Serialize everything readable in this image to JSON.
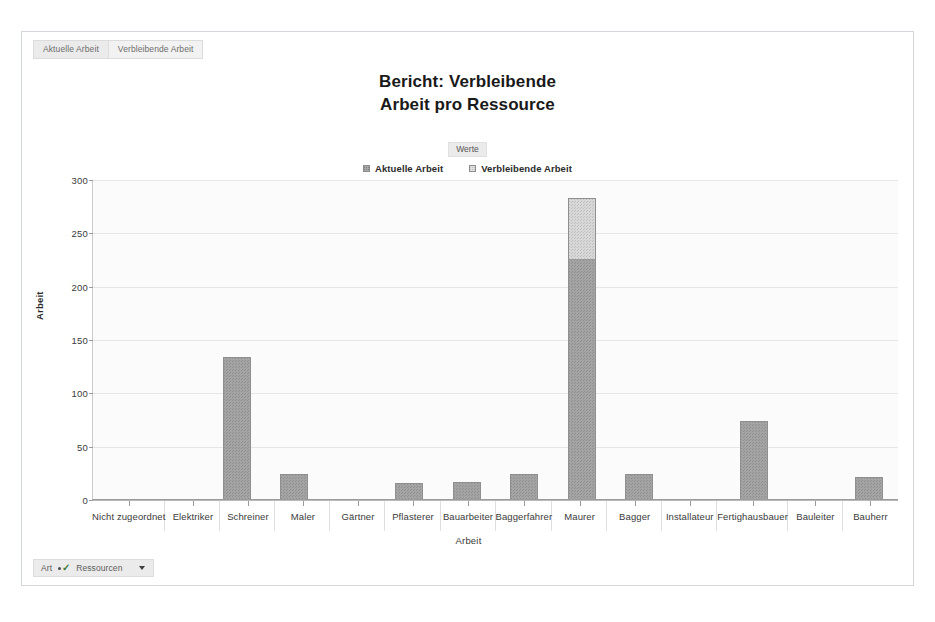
{
  "tabs": [
    {
      "label": "Aktuelle Arbeit",
      "active": false
    },
    {
      "label": "Verbleibende Arbeit",
      "active": true
    }
  ],
  "title": {
    "line1": "Bericht: Verbleibende",
    "line2": "Arbeit pro Ressource",
    "full": "Bericht: Verbleibende Arbeit pro Ressource"
  },
  "legend": {
    "header": "Werte",
    "items": [
      {
        "label": "Aktuelle Arbeit",
        "swatch": "hatched-dark-square-icon"
      },
      {
        "label": "Verbleibende Arbeit",
        "swatch": "hatched-light-square-icon"
      }
    ]
  },
  "filter_bar": {
    "field_label": "Art",
    "filter_icon": "filter-check-icon",
    "value": "Ressourcen",
    "caret": "chevron-down-icon"
  },
  "chart_data": {
    "type": "bar",
    "stacked": true,
    "title": "Bericht: Verbleibende Arbeit pro Ressource",
    "xlabel": "Arbeit",
    "ylabel": "Arbeit",
    "ylim": [
      0,
      300
    ],
    "yticks": [
      0,
      50,
      100,
      150,
      200,
      250,
      300
    ],
    "grid": true,
    "legend_position": "top-center",
    "legend_title": "Werte",
    "categories": [
      "Nicht zugeordnet",
      "Elektriker",
      "Schreiner",
      "Maler",
      "Gärtner",
      "Pflasterer",
      "Bauarbeiter",
      "Baggerfahrer",
      "Maurer",
      "Bagger",
      "Installateur",
      "Fertighausbauer",
      "Bauleiter",
      "Bauherr"
    ],
    "series": [
      {
        "name": "Aktuelle Arbeit",
        "color": "#a4a4a4",
        "values": [
          0,
          0,
          133,
          23,
          0,
          15,
          16,
          23,
          225,
          23,
          0,
          73,
          0,
          21
        ]
      },
      {
        "name": "Verbleibende Arbeit",
        "color": "#d8d8d8",
        "values": [
          0,
          0,
          0,
          0,
          0,
          0,
          0,
          0,
          57,
          0,
          0,
          0,
          0,
          0
        ]
      }
    ],
    "totals": [
      0,
      0,
      133,
      23,
      0,
      15,
      16,
      23,
      282,
      23,
      0,
      73,
      0,
      21
    ]
  }
}
